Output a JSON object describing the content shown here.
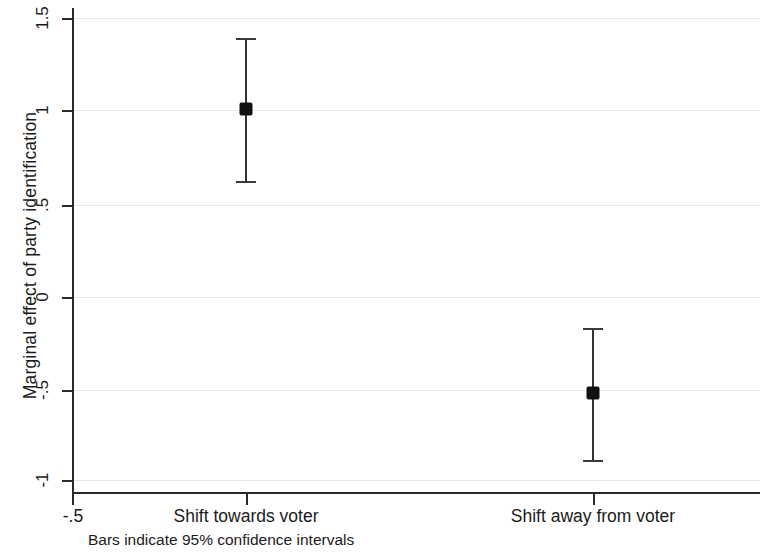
{
  "chart_data": {
    "type": "scatter",
    "title": "",
    "subtitle": "",
    "xlabel": "",
    "ylabel": "Marginal effect of party identification",
    "categories": [
      "Shift towards voter",
      "Shift away from voter"
    ],
    "x": [
      0,
      1
    ],
    "values": [
      1.01,
      -0.53
    ],
    "error_low": [
      0.62,
      -0.89
    ],
    "error_high": [
      1.39,
      -0.18
    ],
    "series": [
      {
        "name": "Marginal effect",
        "points": [
          {
            "category": "Shift towards voter",
            "estimate": 1.01,
            "ci_low": 0.62,
            "ci_high": 1.39
          },
          {
            "category": "Shift away from voter",
            "estimate": -0.53,
            "ci_low": -0.89,
            "ci_high": -0.18
          }
        ]
      }
    ],
    "ylim": [
      -1,
      1.5
    ],
    "yticks": [
      1.5,
      1,
      0.5,
      0,
      -0.5,
      -1
    ],
    "ytick_labels": [
      "1.5",
      "1",
      ".5",
      "0",
      "-.5",
      "-1"
    ],
    "xtick_labels": [
      "-.5"
    ],
    "grid": true,
    "grid_axis": "y",
    "legend": "none",
    "annotations": [
      "Bars indicate 95% confidence intervals"
    ],
    "colors": {
      "marker": "#111111",
      "errorbar": "#333333",
      "axis": "#2a2a2a",
      "grid": "#e6e6e6",
      "background": "#ffffff",
      "text": "#1b1b1b"
    }
  },
  "axes": {
    "y_title": "Marginal effect of party identification",
    "y_ticks": [
      {
        "label": "1.5",
        "value": 1.5
      },
      {
        "label": "1",
        "value": 1
      },
      {
        "label": ".5",
        "value": 0.5
      },
      {
        "label": "0",
        "value": 0
      },
      {
        "label": "-.5",
        "value": -0.5
      },
      {
        "label": "-1",
        "value": -1
      }
    ],
    "x_ticks": [
      {
        "label": "-.5"
      },
      {
        "label": "Shift towards voter"
      },
      {
        "label": "Shift away from voter"
      }
    ]
  },
  "footnote": {
    "text": "Bars indicate 95% confidence intervals"
  }
}
